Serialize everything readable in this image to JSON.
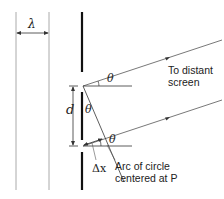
{
  "diagram": {
    "type": "double-slit interference geometry",
    "labels": {
      "wavelength": "λ",
      "slit_separation": "d",
      "angle_upper": "θ",
      "angle_middle": "θ",
      "angle_lower": "θ",
      "path_difference": "Δx",
      "screen_note_line1": "To distant",
      "screen_note_line2": "screen",
      "arc_note_line1": "Arc of circle",
      "arc_note_line2": "centered at P"
    },
    "colors": {
      "barrier": "#111111",
      "rays": "#555555",
      "wavefronts": "#999999",
      "text": "#222222"
    }
  }
}
